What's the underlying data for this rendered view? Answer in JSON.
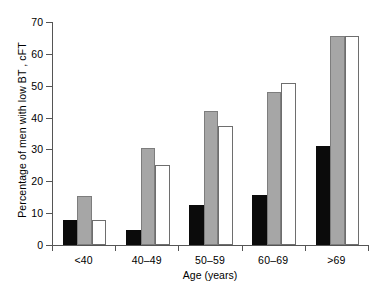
{
  "chart_data": {
    "type": "bar",
    "title": "",
    "xlabel": "Age (years)",
    "ylabel": "Percentage of men with low BT , cFT",
    "categories": [
      "<40",
      "40–49",
      "50–59",
      "60–69",
      ">69"
    ],
    "series": [
      {
        "name": "black",
        "color": "#0b0b0b",
        "values": [
          8.0,
          4.8,
          12.5,
          15.6,
          31.0
        ]
      },
      {
        "name": "gray",
        "color": "#a6a6a6",
        "values": [
          15.4,
          30.3,
          42.0,
          48.0,
          65.5
        ]
      },
      {
        "name": "white",
        "color": "#ffffff",
        "values": [
          7.7,
          25.0,
          37.5,
          50.7,
          65.5
        ]
      }
    ],
    "ylim": [
      0,
      70
    ],
    "yticks": [
      0,
      10,
      20,
      30,
      40,
      50,
      60,
      70
    ],
    "ytick_labels": [
      "0",
      "10",
      "20",
      "30",
      "40",
      "50",
      "60",
      "70"
    ],
    "grid": false,
    "legend": "none",
    "axis_color": "#555555",
    "background": "#ffffff"
  }
}
